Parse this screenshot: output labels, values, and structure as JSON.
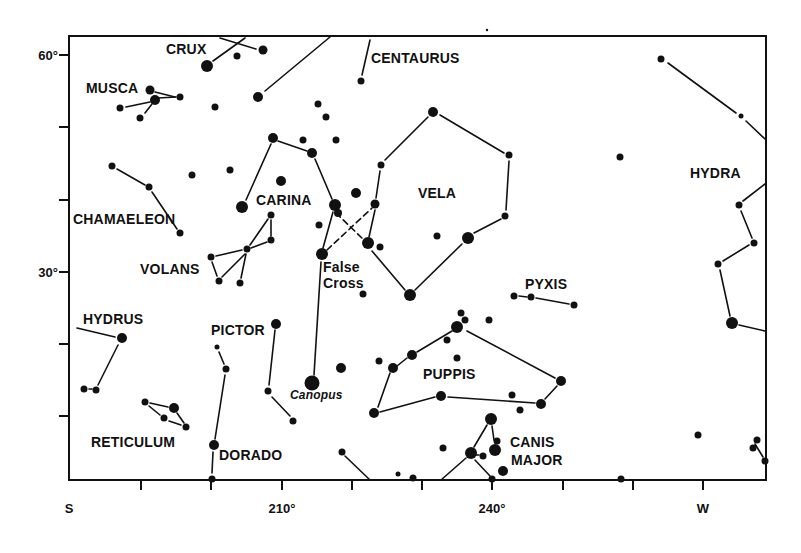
{
  "chart_data": {
    "type": "scatter",
    "title": "",
    "subtitle": "",
    "xlabel": "",
    "ylabel": "",
    "x_axis": {
      "tick_labels": [
        {
          "label": "S",
          "px": 69
        },
        {
          "label": "210°",
          "px": 282
        },
        {
          "label": "240°",
          "px": 492
        },
        {
          "label": "W",
          "px": 703
        }
      ],
      "ticks_px": [
        69,
        141,
        211,
        282,
        352,
        422,
        492,
        563,
        633,
        703
      ],
      "range_deg": [
        180,
        279
      ]
    },
    "y_axis": {
      "tick_labels": [
        {
          "label": "60°",
          "px": 55
        },
        {
          "label": "30°",
          "px": 272
        }
      ],
      "ticks_px": [
        55,
        127,
        200,
        272,
        344,
        416
      ],
      "range_deg": [
        0,
        62
      ]
    },
    "grid": false,
    "legend": null,
    "frame": {
      "left": 69,
      "top": 36,
      "right": 766,
      "bottom": 480
    },
    "constellations": [
      {
        "name": "CRUX",
        "label_x": 166,
        "label_y": 54
      },
      {
        "name": "CENTAURUS",
        "label_x": 371,
        "label_y": 63
      },
      {
        "name": "MUSCA",
        "label_x": 86,
        "label_y": 93
      },
      {
        "name": "CARINA",
        "label_x": 256,
        "label_y": 205
      },
      {
        "name": "VELA",
        "label_x": 418,
        "label_y": 198
      },
      {
        "name": "HYDRA",
        "label_x": 690,
        "label_y": 178
      },
      {
        "name": "CHAMAELEON",
        "label_x": 73,
        "label_y": 224
      },
      {
        "name": "VOLANS",
        "label_x": 140,
        "label_y": 274
      },
      {
        "name": "False",
        "label_x": 323,
        "label_y": 272
      },
      {
        "name": "Cross",
        "label_x": 323,
        "label_y": 288
      },
      {
        "name": "PYXIS",
        "label_x": 525,
        "label_y": 289
      },
      {
        "name": "HYDRUS",
        "label_x": 83,
        "label_y": 324
      },
      {
        "name": "PICTOR",
        "label_x": 211,
        "label_y": 335
      },
      {
        "name": "PUPPIS",
        "label_x": 423,
        "label_y": 379
      },
      {
        "name": "RETICULUM",
        "label_x": 91,
        "label_y": 447
      },
      {
        "name": "DORADO",
        "label_x": 219,
        "label_y": 460
      },
      {
        "name": "CANIS",
        "label_x": 510,
        "label_y": 447
      },
      {
        "name": "MAJOR",
        "label_x": 511,
        "label_y": 465
      }
    ],
    "named_stars": [
      {
        "name": "Canopus",
        "x": 312,
        "y": 383,
        "label_x": 290,
        "label_y": 399
      }
    ],
    "stars": [
      {
        "x": 207,
        "y": 66,
        "r": 6
      },
      {
        "x": 237,
        "y": 56,
        "r": 3.5
      },
      {
        "x": 263,
        "y": 50,
        "r": 4.5
      },
      {
        "x": 361,
        "y": 81,
        "r": 3.5
      },
      {
        "x": 150,
        "y": 90,
        "r": 4.5
      },
      {
        "x": 155,
        "y": 100,
        "r": 5
      },
      {
        "x": 180,
        "y": 97,
        "r": 3.5
      },
      {
        "x": 120,
        "y": 108,
        "r": 3.5
      },
      {
        "x": 140,
        "y": 118,
        "r": 3.5
      },
      {
        "x": 258,
        "y": 97,
        "r": 5
      },
      {
        "x": 215,
        "y": 107,
        "r": 3.5
      },
      {
        "x": 318,
        "y": 104,
        "r": 3.5
      },
      {
        "x": 326,
        "y": 117,
        "r": 3.5
      },
      {
        "x": 273,
        "y": 138,
        "r": 5
      },
      {
        "x": 303,
        "y": 140,
        "r": 3.5
      },
      {
        "x": 336,
        "y": 140,
        "r": 3.5
      },
      {
        "x": 312,
        "y": 153,
        "r": 5
      },
      {
        "x": 433,
        "y": 112,
        "r": 5
      },
      {
        "x": 509,
        "y": 155,
        "r": 3.5
      },
      {
        "x": 381,
        "y": 165,
        "r": 3.5
      },
      {
        "x": 112,
        "y": 166,
        "r": 3.5
      },
      {
        "x": 149,
        "y": 187,
        "r": 3.5
      },
      {
        "x": 192,
        "y": 175,
        "r": 3.5
      },
      {
        "x": 230,
        "y": 170,
        "r": 3.5
      },
      {
        "x": 281,
        "y": 181,
        "r": 5
      },
      {
        "x": 356,
        "y": 193,
        "r": 5
      },
      {
        "x": 242,
        "y": 207,
        "r": 6
      },
      {
        "x": 335,
        "y": 205,
        "r": 6
      },
      {
        "x": 338,
        "y": 213,
        "r": 4
      },
      {
        "x": 375,
        "y": 204,
        "r": 4.5
      },
      {
        "x": 180,
        "y": 233,
        "r": 3.5
      },
      {
        "x": 319,
        "y": 225,
        "r": 3.5
      },
      {
        "x": 271,
        "y": 215,
        "r": 3.5
      },
      {
        "x": 271,
        "y": 240,
        "r": 3.5
      },
      {
        "x": 247,
        "y": 249,
        "r": 3.5
      },
      {
        "x": 211,
        "y": 257,
        "r": 3.5
      },
      {
        "x": 219,
        "y": 281,
        "r": 3.5
      },
      {
        "x": 240,
        "y": 283,
        "r": 3.5
      },
      {
        "x": 322,
        "y": 254,
        "r": 6
      },
      {
        "x": 368,
        "y": 243,
        "r": 6
      },
      {
        "x": 380,
        "y": 247,
        "r": 3.5
      },
      {
        "x": 437,
        "y": 236,
        "r": 3.5
      },
      {
        "x": 468,
        "y": 238,
        "r": 6
      },
      {
        "x": 505,
        "y": 216,
        "r": 3.5
      },
      {
        "x": 620,
        "y": 157,
        "r": 3.5
      },
      {
        "x": 661,
        "y": 59,
        "r": 3.5
      },
      {
        "x": 741,
        "y": 116,
        "r": 2.5
      },
      {
        "x": 739,
        "y": 205,
        "r": 3.5
      },
      {
        "x": 754,
        "y": 243,
        "r": 3.5
      },
      {
        "x": 718,
        "y": 264,
        "r": 3.5
      },
      {
        "x": 732,
        "y": 323,
        "r": 6
      },
      {
        "x": 410,
        "y": 295,
        "r": 6
      },
      {
        "x": 363,
        "y": 294,
        "r": 3.5
      },
      {
        "x": 514,
        "y": 296,
        "r": 3.5
      },
      {
        "x": 531,
        "y": 297,
        "r": 3.5
      },
      {
        "x": 574,
        "y": 305,
        "r": 3.5
      },
      {
        "x": 122,
        "y": 338,
        "r": 5
      },
      {
        "x": 84,
        "y": 389,
        "r": 3.5
      },
      {
        "x": 96,
        "y": 390,
        "r": 3.5
      },
      {
        "x": 276,
        "y": 324,
        "r": 5
      },
      {
        "x": 217,
        "y": 347,
        "r": 2.5
      },
      {
        "x": 226,
        "y": 369,
        "r": 3.5
      },
      {
        "x": 268,
        "y": 391,
        "r": 3.5
      },
      {
        "x": 293,
        "y": 421,
        "r": 3.5
      },
      {
        "x": 312,
        "y": 383,
        "r": 7.5
      },
      {
        "x": 341,
        "y": 368,
        "r": 5
      },
      {
        "x": 379,
        "y": 361,
        "r": 3.5
      },
      {
        "x": 393,
        "y": 368,
        "r": 5
      },
      {
        "x": 412,
        "y": 355,
        "r": 5
      },
      {
        "x": 374,
        "y": 413,
        "r": 5
      },
      {
        "x": 441,
        "y": 396,
        "r": 5
      },
      {
        "x": 457,
        "y": 327,
        "r": 6
      },
      {
        "x": 461,
        "y": 313,
        "r": 3.5
      },
      {
        "x": 465,
        "y": 320,
        "r": 3.5
      },
      {
        "x": 447,
        "y": 340,
        "r": 3.5
      },
      {
        "x": 457,
        "y": 358,
        "r": 3.5
      },
      {
        "x": 489,
        "y": 320,
        "r": 3.5
      },
      {
        "x": 561,
        "y": 381,
        "r": 5
      },
      {
        "x": 512,
        "y": 395,
        "r": 3.5
      },
      {
        "x": 541,
        "y": 404,
        "r": 5
      },
      {
        "x": 520,
        "y": 410,
        "r": 3.5
      },
      {
        "x": 145,
        "y": 402,
        "r": 3.5
      },
      {
        "x": 174,
        "y": 408,
        "r": 5
      },
      {
        "x": 164,
        "y": 418,
        "r": 3.5
      },
      {
        "x": 186,
        "y": 427,
        "r": 3.5
      },
      {
        "x": 214,
        "y": 445,
        "r": 5
      },
      {
        "x": 212,
        "y": 479,
        "r": 3.5
      },
      {
        "x": 342,
        "y": 452,
        "r": 3.5
      },
      {
        "x": 398,
        "y": 474,
        "r": 2.5
      },
      {
        "x": 413,
        "y": 478,
        "r": 3.5
      },
      {
        "x": 443,
        "y": 448,
        "r": 3.5
      },
      {
        "x": 491,
        "y": 419,
        "r": 6
      },
      {
        "x": 471,
        "y": 453,
        "r": 6
      },
      {
        "x": 483,
        "y": 456,
        "r": 3.5
      },
      {
        "x": 495,
        "y": 450,
        "r": 6
      },
      {
        "x": 497,
        "y": 441,
        "r": 3.5
      },
      {
        "x": 503,
        "y": 471,
        "r": 5
      },
      {
        "x": 492,
        "y": 479,
        "r": 3.5
      },
      {
        "x": 621,
        "y": 479,
        "r": 3.5
      },
      {
        "x": 698,
        "y": 435,
        "r": 3.5
      },
      {
        "x": 757,
        "y": 440,
        "r": 3.5
      },
      {
        "x": 753,
        "y": 448,
        "r": 3.5
      },
      {
        "x": 765,
        "y": 461,
        "r": 3.5
      }
    ],
    "lines": [
      {
        "x1": 213,
        "y1": 61,
        "x2": 245,
        "y2": 38,
        "style": "solid"
      },
      {
        "x1": 220,
        "y1": 38,
        "x2": 256,
        "y2": 49,
        "style": "solid"
      },
      {
        "x1": 265,
        "y1": 91,
        "x2": 330,
        "y2": 37,
        "style": "solid"
      },
      {
        "x1": 362,
        "y1": 75,
        "x2": 370,
        "y2": 40,
        "style": "solid"
      },
      {
        "x1": 155,
        "y1": 92,
        "x2": 175,
        "y2": 97,
        "style": "solid"
      },
      {
        "x1": 158,
        "y1": 98,
        "x2": 176,
        "y2": 97,
        "style": "solid"
      },
      {
        "x1": 126,
        "y1": 107,
        "x2": 150,
        "y2": 102,
        "style": "solid"
      },
      {
        "x1": 145,
        "y1": 113,
        "x2": 152,
        "y2": 104,
        "style": "solid"
      },
      {
        "x1": 246,
        "y1": 200,
        "x2": 271,
        "y2": 144,
        "style": "solid"
      },
      {
        "x1": 278,
        "y1": 141,
        "x2": 307,
        "y2": 151,
        "style": "solid"
      },
      {
        "x1": 315,
        "y1": 159,
        "x2": 332,
        "y2": 199,
        "style": "solid"
      },
      {
        "x1": 117,
        "y1": 169,
        "x2": 145,
        "y2": 185,
        "style": "solid"
      },
      {
        "x1": 152,
        "y1": 192,
        "x2": 177,
        "y2": 229,
        "style": "solid"
      },
      {
        "x1": 271,
        "y1": 220,
        "x2": 271,
        "y2": 236,
        "style": "solid"
      },
      {
        "x1": 250,
        "y1": 245,
        "x2": 268,
        "y2": 219,
        "style": "solid"
      },
      {
        "x1": 251,
        "y1": 248,
        "x2": 267,
        "y2": 242,
        "style": "solid"
      },
      {
        "x1": 216,
        "y1": 256,
        "x2": 242,
        "y2": 250,
        "style": "solid"
      },
      {
        "x1": 212,
        "y1": 262,
        "x2": 217,
        "y2": 276,
        "style": "solid"
      },
      {
        "x1": 222,
        "y1": 277,
        "x2": 245,
        "y2": 254,
        "style": "solid"
      },
      {
        "x1": 241,
        "y1": 278,
        "x2": 246,
        "y2": 254,
        "style": "solid"
      },
      {
        "x1": 333,
        "y1": 212,
        "x2": 323,
        "y2": 248,
        "style": "solid"
      },
      {
        "x1": 336,
        "y1": 213,
        "x2": 364,
        "y2": 240,
        "style": "dashed"
      },
      {
        "x1": 327,
        "y1": 250,
        "x2": 372,
        "y2": 208,
        "style": "dashed"
      },
      {
        "x1": 369,
        "y1": 237,
        "x2": 375,
        "y2": 210,
        "style": "solid"
      },
      {
        "x1": 376,
        "y1": 198,
        "x2": 380,
        "y2": 171,
        "style": "solid"
      },
      {
        "x1": 385,
        "y1": 160,
        "x2": 428,
        "y2": 117,
        "style": "solid"
      },
      {
        "x1": 440,
        "y1": 115,
        "x2": 504,
        "y2": 153,
        "style": "solid"
      },
      {
        "x1": 509,
        "y1": 161,
        "x2": 506,
        "y2": 210,
        "style": "solid"
      },
      {
        "x1": 501,
        "y1": 219,
        "x2": 474,
        "y2": 233,
        "style": "solid"
      },
      {
        "x1": 462,
        "y1": 244,
        "x2": 415,
        "y2": 290,
        "style": "solid"
      },
      {
        "x1": 372,
        "y1": 251,
        "x2": 405,
        "y2": 290,
        "style": "solid"
      },
      {
        "x1": 321,
        "y1": 262,
        "x2": 314,
        "y2": 375,
        "style": "solid"
      },
      {
        "x1": 668,
        "y1": 63,
        "x2": 736,
        "y2": 113,
        "style": "solid"
      },
      {
        "x1": 746,
        "y1": 121,
        "x2": 765,
        "y2": 139,
        "style": "solid"
      },
      {
        "x1": 743,
        "y1": 201,
        "x2": 765,
        "y2": 184,
        "style": "solid"
      },
      {
        "x1": 741,
        "y1": 211,
        "x2": 752,
        "y2": 238,
        "style": "solid"
      },
      {
        "x1": 749,
        "y1": 245,
        "x2": 723,
        "y2": 261,
        "style": "solid"
      },
      {
        "x1": 720,
        "y1": 270,
        "x2": 730,
        "y2": 316,
        "style": "solid"
      },
      {
        "x1": 739,
        "y1": 325,
        "x2": 765,
        "y2": 331,
        "style": "solid"
      },
      {
        "x1": 519,
        "y1": 296,
        "x2": 527,
        "y2": 297,
        "style": "solid"
      },
      {
        "x1": 536,
        "y1": 298,
        "x2": 569,
        "y2": 304,
        "style": "solid"
      },
      {
        "x1": 77,
        "y1": 328,
        "x2": 115,
        "y2": 337,
        "style": "solid"
      },
      {
        "x1": 118,
        "y1": 345,
        "x2": 98,
        "y2": 385,
        "style": "solid"
      },
      {
        "x1": 89,
        "y1": 389,
        "x2": 92,
        "y2": 389,
        "style": "solid"
      },
      {
        "x1": 275,
        "y1": 330,
        "x2": 269,
        "y2": 385,
        "style": "solid"
      },
      {
        "x1": 272,
        "y1": 397,
        "x2": 290,
        "y2": 416,
        "style": "solid"
      },
      {
        "x1": 219,
        "y1": 352,
        "x2": 224,
        "y2": 364,
        "style": "solid"
      },
      {
        "x1": 225,
        "y1": 375,
        "x2": 215,
        "y2": 439,
        "style": "solid"
      },
      {
        "x1": 213,
        "y1": 452,
        "x2": 212,
        "y2": 473,
        "style": "solid"
      },
      {
        "x1": 150,
        "y1": 403,
        "x2": 168,
        "y2": 407,
        "style": "solid"
      },
      {
        "x1": 149,
        "y1": 406,
        "x2": 160,
        "y2": 415,
        "style": "solid"
      },
      {
        "x1": 169,
        "y1": 421,
        "x2": 181,
        "y2": 425,
        "style": "solid"
      },
      {
        "x1": 177,
        "y1": 413,
        "x2": 184,
        "y2": 423,
        "style": "solid"
      },
      {
        "x1": 378,
        "y1": 407,
        "x2": 390,
        "y2": 373,
        "style": "solid"
      },
      {
        "x1": 397,
        "y1": 366,
        "x2": 407,
        "y2": 358,
        "style": "solid"
      },
      {
        "x1": 417,
        "y1": 352,
        "x2": 452,
        "y2": 331,
        "style": "solid"
      },
      {
        "x1": 380,
        "y1": 412,
        "x2": 435,
        "y2": 397,
        "style": "solid"
      },
      {
        "x1": 448,
        "y1": 397,
        "x2": 535,
        "y2": 403,
        "style": "solid"
      },
      {
        "x1": 545,
        "y1": 399,
        "x2": 557,
        "y2": 386,
        "style": "solid"
      },
      {
        "x1": 467,
        "y1": 331,
        "x2": 555,
        "y2": 378,
        "style": "solid"
      },
      {
        "x1": 345,
        "y1": 456,
        "x2": 370,
        "y2": 480,
        "style": "solid"
      },
      {
        "x1": 441,
        "y1": 480,
        "x2": 466,
        "y2": 458,
        "style": "solid"
      },
      {
        "x1": 474,
        "y1": 447,
        "x2": 487,
        "y2": 425,
        "style": "solid"
      },
      {
        "x1": 492,
        "y1": 426,
        "x2": 494,
        "y2": 440,
        "style": "solid"
      },
      {
        "x1": 476,
        "y1": 455,
        "x2": 479,
        "y2": 455,
        "style": "solid"
      },
      {
        "x1": 475,
        "y1": 460,
        "x2": 490,
        "y2": 476,
        "style": "solid"
      },
      {
        "x1": 755,
        "y1": 444,
        "x2": 763,
        "y2": 457,
        "style": "solid"
      }
    ]
  },
  "stray_marks": [
    {
      "x": 487,
      "y": 30,
      "r": 1.2
    }
  ]
}
